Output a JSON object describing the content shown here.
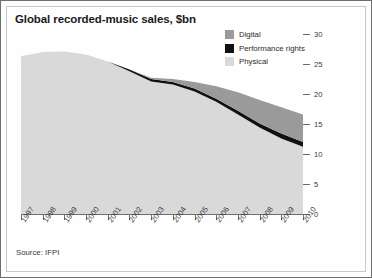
{
  "title": "Global recorded-music sales, $bn",
  "source": "Source: IFPI",
  "legend": {
    "items": [
      {
        "label": "Digital",
        "color": "#9a9a9a"
      },
      {
        "label": "Performance rights",
        "color": "#111111"
      },
      {
        "label": "Physical",
        "color": "#d9d9d9"
      }
    ]
  },
  "axes": {
    "y_ticks": [
      "0",
      "5",
      "10",
      "15",
      "20",
      "25",
      "30"
    ],
    "x_ticks": [
      "1997",
      "1998",
      "1999",
      "2000",
      "2001",
      "2002",
      "2003",
      "2004",
      "2005",
      "2006",
      "2007",
      "2008",
      "2009",
      "2010"
    ]
  },
  "chart_data": {
    "type": "area",
    "stacked": true,
    "title": "Global recorded-music sales, $bn",
    "subtitle": "",
    "xlabel": "",
    "ylabel": "$bn",
    "ylim": [
      0,
      30
    ],
    "grid": false,
    "legend_position": "top-right",
    "annotations": [
      "Source: IFPI"
    ],
    "categories": [
      "1997",
      "1998",
      "1999",
      "2000",
      "2001",
      "2002",
      "2003",
      "2004",
      "2005",
      "2006",
      "2007",
      "2008",
      "2009",
      "2010"
    ],
    "series": [
      {
        "name": "Physical",
        "color": "#d9d9d9",
        "values": [
          26.3,
          27.0,
          27.1,
          26.6,
          25.4,
          23.8,
          22.1,
          21.6,
          20.4,
          18.7,
          16.6,
          14.4,
          12.6,
          11.2
        ]
      },
      {
        "name": "Performance rights",
        "color": "#111111",
        "values": [
          0.0,
          0.0,
          0.0,
          0.0,
          0.0,
          0.3,
          0.4,
          0.4,
          0.5,
          0.5,
          0.6,
          0.7,
          0.8,
          0.8
        ]
      },
      {
        "name": "Digital",
        "color": "#9a9a9a",
        "values": [
          0.0,
          0.0,
          0.0,
          0.0,
          0.0,
          0.0,
          0.2,
          0.5,
          1.1,
          2.1,
          3.1,
          3.9,
          4.4,
          4.6
        ]
      }
    ],
    "totals": [
      26.3,
      27.0,
      27.1,
      26.6,
      25.4,
      24.1,
      22.7,
      22.5,
      22.0,
      21.3,
      20.3,
      19.0,
      17.8,
      16.6
    ]
  }
}
